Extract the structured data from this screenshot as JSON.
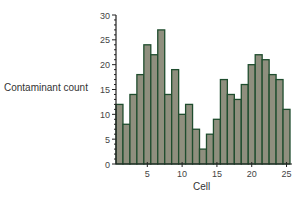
{
  "chart_data": {
    "type": "bar",
    "title": "",
    "xlabel": "Cell",
    "ylabel": "Contaminant count",
    "categories": [
      1,
      2,
      3,
      4,
      5,
      6,
      7,
      8,
      9,
      10,
      11,
      12,
      13,
      14,
      15,
      16,
      17,
      18,
      19,
      20,
      21,
      22,
      23,
      24,
      25
    ],
    "values": [
      12,
      8,
      14,
      18,
      24,
      22,
      27,
      14,
      19,
      10,
      12,
      7,
      3,
      6,
      9,
      17,
      14,
      13,
      16,
      20,
      22,
      21,
      18,
      17,
      11
    ],
    "ylim": [
      0,
      30
    ],
    "yticks": [
      0,
      5,
      10,
      15,
      20,
      25,
      30
    ],
    "xticks": [
      5,
      10,
      15,
      20,
      25
    ],
    "grid": false,
    "legend": null,
    "colors": {
      "bar_fill": "#8f8f7e",
      "bar_edge": "#1f4d2e",
      "axis": "#222222"
    }
  }
}
